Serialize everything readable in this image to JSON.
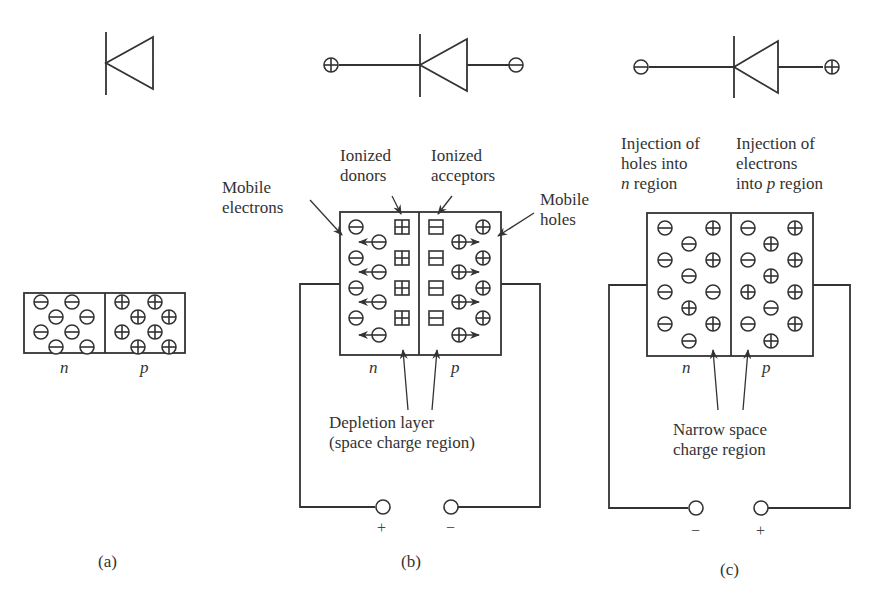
{
  "figure": {
    "panels": [
      {
        "id": "a",
        "caption": "(a)",
        "diode_symbol": "diode-icon",
        "regions": {
          "n": "n",
          "p": "p"
        },
        "n_region_carriers": "electrons (⊖)",
        "p_region_carriers": "holes (⊕)"
      },
      {
        "id": "b",
        "caption": "(b)",
        "bias": "reverse",
        "terminal_left": "⊕",
        "terminal_right": "⊖",
        "labels": {
          "ionized_donors": [
            "Ionized",
            "donors"
          ],
          "ionized_acceptors": [
            "Ionized",
            "acceptors"
          ],
          "mobile_electrons": [
            "Mobile",
            "electrons"
          ],
          "mobile_holes": [
            "Mobile",
            "holes"
          ],
          "depletion": [
            "Depletion layer",
            "(space charge region)"
          ]
        },
        "regions": {
          "n": "n",
          "p": "p"
        },
        "supply": {
          "left": "+",
          "right": "−"
        }
      },
      {
        "id": "c",
        "caption": "(c)",
        "bias": "forward",
        "terminal_left": "⊖",
        "terminal_right": "⊕",
        "labels": {
          "inject_holes": [
            "Injection of",
            "holes into",
            "region"
          ],
          "inject_holes_ital": "n",
          "inject_electrons": [
            "Injection of",
            "electrons",
            "into",
            "region"
          ],
          "inject_electrons_ital": "p",
          "narrow": [
            "Narrow space",
            "charge region"
          ]
        },
        "regions": {
          "n": "n",
          "p": "p"
        },
        "supply": {
          "left": "−",
          "right": "+"
        }
      }
    ]
  }
}
